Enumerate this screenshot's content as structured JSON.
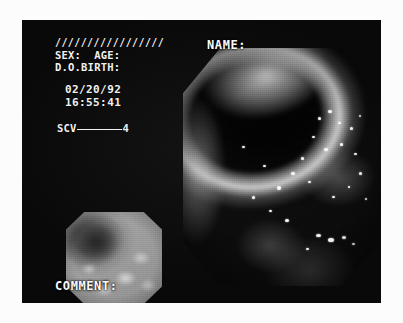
{
  "print": {
    "background_color": "#fcfcfc",
    "frame_color": "#090909",
    "overlay_text_color": "#f2f2f2"
  },
  "overlay": {
    "hatch_marks": "/////////////////",
    "sex_age_line": "SEX:  AGE:",
    "date_of_birth_line": "D.O.BIRTH:",
    "date": "02/20/92",
    "time": "16:55:41",
    "scv_label": "SCV",
    "scv_value": "4"
  },
  "fields": {
    "name_label": "NAME:",
    "name_value": "",
    "comment_label": "COMMENT:",
    "comment_value": ""
  },
  "images": {
    "main": {
      "name": "main-endoscopic-image",
      "shape": "octagon",
      "modality": "endoscopy",
      "description": "Gastric mucosa with dark lumen upper-left, bright illuminated fold and scattered specular highlights"
    },
    "thumbnail": {
      "name": "thumbnail-endoscopic-image",
      "shape": "octagon",
      "modality": "endoscopy",
      "description": "Bright close-up view with dark lesion at upper left"
    }
  }
}
